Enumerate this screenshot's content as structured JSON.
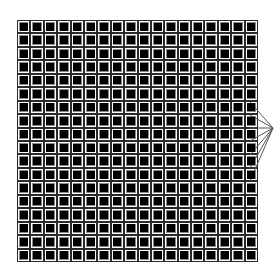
{
  "figure": {
    "grid": {
      "rows": 18,
      "cols": 18,
      "left": 17,
      "top": 20,
      "width": 241,
      "height": 242,
      "line_color": "#2a2a2a",
      "inner_ring_color": "#8a8a8a",
      "cell_background": "#ffffff",
      "square_color": "#000000",
      "square_size": 8
    },
    "fan": {
      "apex": [
        273,
        128
      ],
      "color": "#555555",
      "origins": [
        [
          250,
          102
        ],
        [
          250,
          115
        ],
        [
          250,
          128
        ],
        [
          250,
          141
        ],
        [
          250,
          155
        ],
        [
          250,
          168
        ],
        [
          250,
          181
        ]
      ]
    }
  }
}
